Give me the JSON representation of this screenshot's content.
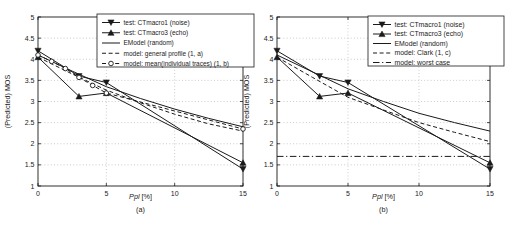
{
  "figure": {
    "background": "#ffffff",
    "line_color": "#1a1a1a",
    "grid_color": "#b5b5b5",
    "legend_border_color": "#1a1a1a"
  },
  "chart_data": [
    {
      "type": "line",
      "caption": "(a)",
      "xlabel": "Ppl [%]",
      "xlabel_italic": "Ppl",
      "xlabel_rest": " [%]",
      "ylabel": "(Predicted) MOS",
      "xlim": [
        0,
        15
      ],
      "ylim": [
        1,
        5
      ],
      "xticks": [
        0,
        5,
        10,
        15
      ],
      "yticks": [
        1,
        1.5,
        2,
        2.5,
        3,
        3.5,
        4,
        4.5,
        5
      ],
      "grid": true,
      "legend_position": "top-right",
      "series": [
        {
          "name": "test: CTmacro1 (noise)",
          "line": "solid",
          "marker": "triangle-down",
          "x": [
            0,
            3,
            5,
            15
          ],
          "y": [
            4.2,
            3.6,
            3.45,
            1.4
          ]
        },
        {
          "name": "test: CTmacro3 (echo)",
          "line": "solid",
          "marker": "triangle-up",
          "x": [
            0,
            3,
            5,
            15
          ],
          "y": [
            4.05,
            3.12,
            3.2,
            1.55
          ]
        },
        {
          "name": "EModel (random)",
          "line": "solid",
          "marker": "none",
          "x": [
            0,
            2.5,
            5,
            7.5,
            10,
            12.5,
            15
          ],
          "y": [
            4.1,
            3.72,
            3.35,
            3.07,
            2.82,
            2.6,
            2.4
          ]
        },
        {
          "name": "model: general profile (1, a)",
          "line": "dashed",
          "marker": "none",
          "x": [
            0,
            2.5,
            5,
            7.5,
            10,
            12.5,
            15
          ],
          "y": [
            4.05,
            3.65,
            3.27,
            2.97,
            2.7,
            2.47,
            2.3
          ]
        },
        {
          "name": "model: mean(individual traces) (1, b)",
          "line": "dashed",
          "marker": "circle",
          "x": [
            0,
            1,
            2,
            3,
            4,
            5,
            15
          ],
          "y": [
            4.1,
            3.95,
            3.78,
            3.57,
            3.38,
            3.2,
            2.35
          ]
        }
      ]
    },
    {
      "type": "line",
      "caption": "(b)",
      "xlabel": "Ppl [%]",
      "xlabel_italic": "Ppl",
      "xlabel_rest": " [%]",
      "ylabel": "(Predicted) MOS",
      "xlim": [
        0,
        15
      ],
      "ylim": [
        1,
        5
      ],
      "xticks": [
        0,
        5,
        10,
        15
      ],
      "yticks": [
        1,
        1.5,
        2,
        2.5,
        3,
        3.5,
        4,
        4.5,
        5
      ],
      "grid": true,
      "legend_position": "top-right",
      "series": [
        {
          "name": "test: CTmacro1 (noise)",
          "line": "solid",
          "marker": "triangle-down",
          "x": [
            0,
            3,
            5,
            15
          ],
          "y": [
            4.2,
            3.6,
            3.45,
            1.4
          ]
        },
        {
          "name": "test: CTmacro3 (echo)",
          "line": "solid",
          "marker": "triangle-up",
          "x": [
            0,
            3,
            5,
            15
          ],
          "y": [
            4.05,
            3.12,
            3.2,
            1.55
          ]
        },
        {
          "name": "EModel (random)",
          "line": "solid",
          "marker": "none",
          "x": [
            0,
            2.5,
            5,
            7.5,
            10,
            12.5,
            15
          ],
          "y": [
            4.1,
            3.7,
            3.3,
            3.0,
            2.72,
            2.5,
            2.3
          ]
        },
        {
          "name": "model: Clark (1, c)",
          "line": "dashed",
          "marker": "none",
          "x": [
            0,
            2.5,
            5,
            7.5,
            10,
            12.5,
            15
          ],
          "y": [
            4.05,
            3.57,
            3.1,
            2.8,
            2.5,
            2.27,
            2.05
          ]
        },
        {
          "name": "model: worst case",
          "line": "dashdot",
          "marker": "none",
          "x": [
            0,
            15
          ],
          "y": [
            1.7,
            1.7
          ]
        }
      ]
    }
  ]
}
